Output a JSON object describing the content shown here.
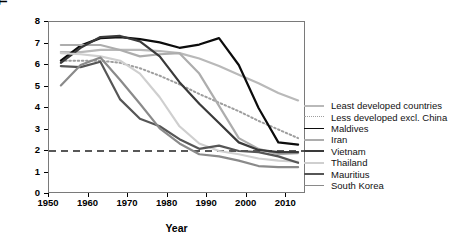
{
  "chart_data": {
    "type": "line",
    "title": "",
    "xlabel": "Year",
    "ylabel": "TFR (births per woman)",
    "xlim": [
      1950,
      2015
    ],
    "ylim": [
      0,
      8
    ],
    "xticks": [
      1950,
      1960,
      1970,
      1980,
      1990,
      2000,
      2010
    ],
    "yticks": [
      0,
      1,
      2,
      3,
      4,
      5,
      6,
      7,
      8
    ],
    "grid": false,
    "legend_position": "right",
    "reference_line": {
      "label": "",
      "value": 2,
      "style": "dashed",
      "color": "#222222"
    },
    "x": [
      1953,
      1958,
      1963,
      1968,
      1973,
      1978,
      1983,
      1988,
      1993,
      1998,
      2003,
      2008,
      2013
    ],
    "series": [
      {
        "name": "Least developed countries",
        "color": "#b9b9b9",
        "width": 2.2,
        "style": "solid",
        "values": [
          6.6,
          6.6,
          6.7,
          6.7,
          6.7,
          6.65,
          6.55,
          6.3,
          5.95,
          5.55,
          5.15,
          4.7,
          4.35
        ]
      },
      {
        "name": "Less developed excl. China",
        "color": "#9e9e9e",
        "width": 2.0,
        "style": "dotted",
        "values": [
          6.2,
          6.2,
          6.2,
          6.1,
          5.85,
          5.5,
          5.1,
          4.65,
          4.25,
          3.85,
          3.4,
          3.0,
          2.6
        ]
      },
      {
        "name": "Maldives",
        "color": "#0c0c0c",
        "width": 2.2,
        "style": "solid",
        "values": [
          6.2,
          6.9,
          7.25,
          7.3,
          7.2,
          7.05,
          6.8,
          6.95,
          7.25,
          6.0,
          4.0,
          2.4,
          2.3
        ]
      },
      {
        "name": "Iran",
        "color": "#adadad",
        "width": 2.2,
        "style": "solid",
        "values": [
          6.93,
          6.93,
          6.93,
          6.7,
          6.4,
          6.5,
          6.55,
          5.6,
          4.1,
          2.6,
          2.1,
          1.85,
          1.9
        ]
      },
      {
        "name": "Vietnam",
        "color": "#3a3a3a",
        "width": 2.2,
        "style": "solid",
        "values": [
          6.1,
          6.8,
          7.3,
          7.35,
          7.1,
          6.4,
          5.2,
          4.2,
          3.3,
          2.4,
          2.05,
          1.95,
          1.95
        ]
      },
      {
        "name": "Thailand",
        "color": "#cfcfcf",
        "width": 2.2,
        "style": "solid",
        "values": [
          6.55,
          6.5,
          6.4,
          6.2,
          5.6,
          4.5,
          3.15,
          2.35,
          2.0,
          1.85,
          1.65,
          1.55,
          1.5
        ]
      },
      {
        "name": "Mauritius",
        "color": "#565656",
        "width": 2.2,
        "style": "solid",
        "values": [
          5.95,
          5.9,
          6.15,
          4.4,
          3.5,
          3.15,
          2.55,
          2.1,
          2.25,
          2.0,
          1.95,
          1.75,
          1.45
        ]
      },
      {
        "name": "South Korea",
        "color": "#8a8a8a",
        "width": 2.2,
        "style": "solid",
        "values": [
          5.05,
          6.0,
          6.35,
          5.3,
          4.2,
          3.05,
          2.35,
          1.85,
          1.75,
          1.55,
          1.3,
          1.25,
          1.25
        ]
      }
    ]
  },
  "legend": {
    "items": [
      {
        "label": "Least developed countries"
      },
      {
        "label": "Less developed excl. China"
      },
      {
        "label": "Maldives"
      },
      {
        "label": "Iran"
      },
      {
        "label": "Vietnam"
      },
      {
        "label": "Thailand"
      },
      {
        "label": "Mauritius"
      },
      {
        "label": "South Korea"
      }
    ]
  }
}
